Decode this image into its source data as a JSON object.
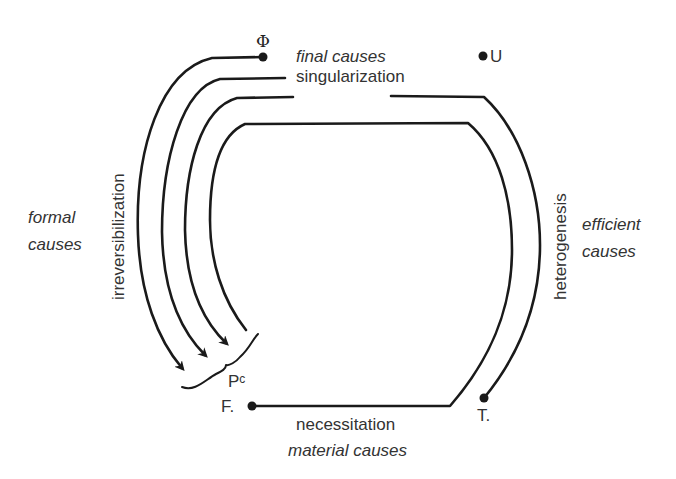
{
  "diagram": {
    "nodes": {
      "phi": {
        "label": "Φ"
      },
      "u": {
        "label": "U"
      },
      "f": {
        "label": "F."
      },
      "t": {
        "label": "T."
      },
      "pc": {
        "label": "P",
        "superscript": "c"
      }
    },
    "labels": {
      "top_cause": "final causes",
      "top_process": "singularization",
      "left_cause_line1": "formal",
      "left_cause_line2": "causes",
      "left_process": "irreversibilization",
      "right_cause_line1": "efficient",
      "right_cause_line2": "causes",
      "right_process": "heterogenesis",
      "bottom_process": "necessitation",
      "bottom_cause": "material causes"
    },
    "colors": {
      "line": "#1a1a1a",
      "text": "#333333",
      "background": "#ffffff"
    }
  }
}
